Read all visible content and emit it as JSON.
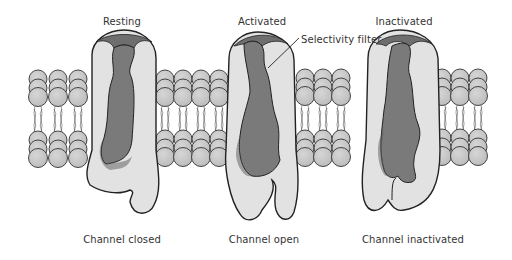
{
  "diagram": {
    "type": "ion-channel-states",
    "states": [
      {
        "top_label": "Resting",
        "bottom_label": "Channel closed"
      },
      {
        "top_label": "Activated",
        "bottom_label": "Channel open"
      },
      {
        "top_label": "Inactivated",
        "bottom_label": "Channel inactivated"
      }
    ],
    "annotation": {
      "text": "Selectivity filter"
    }
  },
  "colors": {
    "protein_light": "#e2e2e2",
    "pore_dark": "#7a7a7a",
    "lipid_head": "#c8c8c8",
    "outline": "#222222",
    "text": "#333333"
  }
}
